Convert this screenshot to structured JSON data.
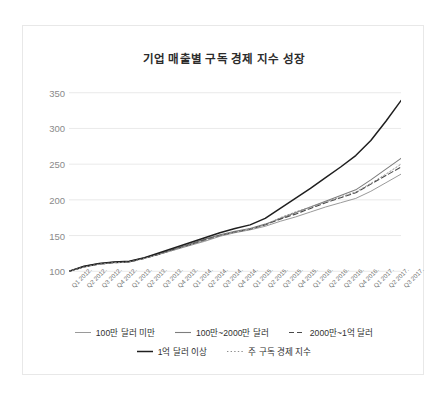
{
  "chart_data": {
    "type": "line",
    "title": "기업 매출별 구독 경제 지수 성장",
    "xlabel": "",
    "ylabel": "",
    "ylim": [
      85,
      365
    ],
    "yticks": [
      100,
      150,
      200,
      250,
      300,
      350
    ],
    "grid": true,
    "legend_position": "bottom",
    "x": [
      "Q1 2012.",
      "Q2 2012.",
      "Q3 2012.",
      "Q4 2012.",
      "Q1 2013.",
      "Q2 2013.",
      "Q3 2013.",
      "Q4 2013.",
      "Q1 2014.",
      "Q2 2014.",
      "Q3 2014.",
      "Q4 2014.",
      "Q1 2015.",
      "Q2 2015.",
      "Q3 2015.",
      "Q4 2015.",
      "Q1 2016.",
      "Q2 2016.",
      "Q3 2016.",
      "Q4 2016.",
      "Q1 2017.",
      "Q2 2017.",
      "Q3 2017."
    ],
    "series": [
      {
        "name": "100만 달러 미만",
        "style": "solid",
        "color": "#9a9a9a",
        "width": 1.0,
        "values": [
          100,
          106,
          110,
          112,
          113,
          118,
          124,
          130,
          136,
          142,
          149,
          154,
          158,
          163,
          170,
          176,
          183,
          190,
          196,
          202,
          212,
          224,
          236
        ]
      },
      {
        "name": "100만~2000만 달러",
        "style": "solid",
        "color": "#7d7d7d",
        "width": 1.1,
        "values": [
          100,
          107,
          111,
          113,
          114,
          119,
          125,
          131,
          138,
          145,
          151,
          156,
          160,
          166,
          174,
          182,
          190,
          198,
          206,
          214,
          228,
          243,
          258
        ]
      },
      {
        "name": "2000만~1억 달러",
        "style": "dashed",
        "color": "#4a4a4a",
        "width": 1.1,
        "values": [
          100,
          106,
          110,
          112,
          113,
          118,
          124,
          131,
          137,
          144,
          150,
          155,
          159,
          165,
          173,
          180,
          188,
          196,
          203,
          210,
          222,
          234,
          246
        ]
      },
      {
        "name": "1억 달러 이상",
        "style": "solid",
        "color": "#1f1f1f",
        "width": 1.5,
        "values": [
          100,
          107,
          111,
          113,
          114,
          119,
          126,
          133,
          140,
          147,
          154,
          160,
          165,
          174,
          188,
          202,
          216,
          231,
          246,
          262,
          283,
          310,
          339
        ]
      },
      {
        "name": "주 구독 경제 지수",
        "style": "dotted",
        "color": "#8f8f8f",
        "width": 1.0,
        "values": [
          100,
          106,
          110,
          112,
          113,
          118,
          124,
          130,
          137,
          143,
          150,
          155,
          159,
          165,
          175,
          183,
          190,
          197,
          204,
          211,
          223,
          236,
          250
        ]
      }
    ]
  }
}
